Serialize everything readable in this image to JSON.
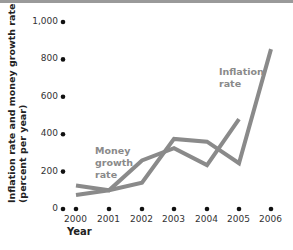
{
  "chart_data": {
    "type": "line",
    "title": "",
    "xlabel": "Year",
    "ylabel": "Inflation rate and money growth rate (percent per year)",
    "x": [
      "2000",
      "2001",
      "2002",
      "2003",
      "2004",
      "2005",
      "2006"
    ],
    "yticks": [
      "0",
      "200",
      "400",
      "600",
      "800",
      "1,000"
    ],
    "ylim": [
      0,
      1000
    ],
    "grid": false,
    "legend": "inline labels",
    "series": [
      {
        "name": "Inflation rate",
        "values": [
          75,
          100,
          140,
          375,
          360,
          245,
          855
        ],
        "color": "#8a8a8a"
      },
      {
        "name": "Money growth rate",
        "values": [
          125,
          100,
          260,
          325,
          235,
          480,
          null
        ],
        "color": "#8a8a8a"
      }
    ]
  },
  "labels": {
    "ytitle_line1": "Inflation rate and money growth rate",
    "ytitle_line2": "(percent per year)",
    "xtitle": "Year",
    "inflation_line1": "Inflation",
    "inflation_line2": "rate",
    "money_line1": "Money",
    "money_line2": "growth",
    "money_line3": "rate"
  }
}
